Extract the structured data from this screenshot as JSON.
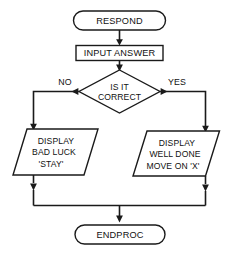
{
  "diagram": {
    "colors": {
      "background": "#ffffff",
      "stroke": "#1a1a1a",
      "text": "#111111",
      "shape_fill": "#ffffff"
    },
    "nodes": {
      "start_terminator": {
        "shape": "stadium",
        "label": "RESPOND"
      },
      "input_process": {
        "shape": "rectangle",
        "label": "INPUT ANSWER"
      },
      "decision": {
        "shape": "diamond",
        "line1": "IS IT",
        "line2": "CORRECT"
      },
      "output_no": {
        "shape": "parallelogram",
        "line1": "DISPLAY",
        "line2": "BAD LUCK",
        "line3": "'STAY'"
      },
      "output_yes": {
        "shape": "parallelogram",
        "line1": "DISPLAY",
        "line2": "WELL DONE",
        "line3": "MOVE ON 'X'"
      },
      "end_terminator": {
        "shape": "stadium",
        "label": "ENDPROC"
      }
    },
    "branch_labels": {
      "no": "NO",
      "yes": "YES"
    }
  }
}
